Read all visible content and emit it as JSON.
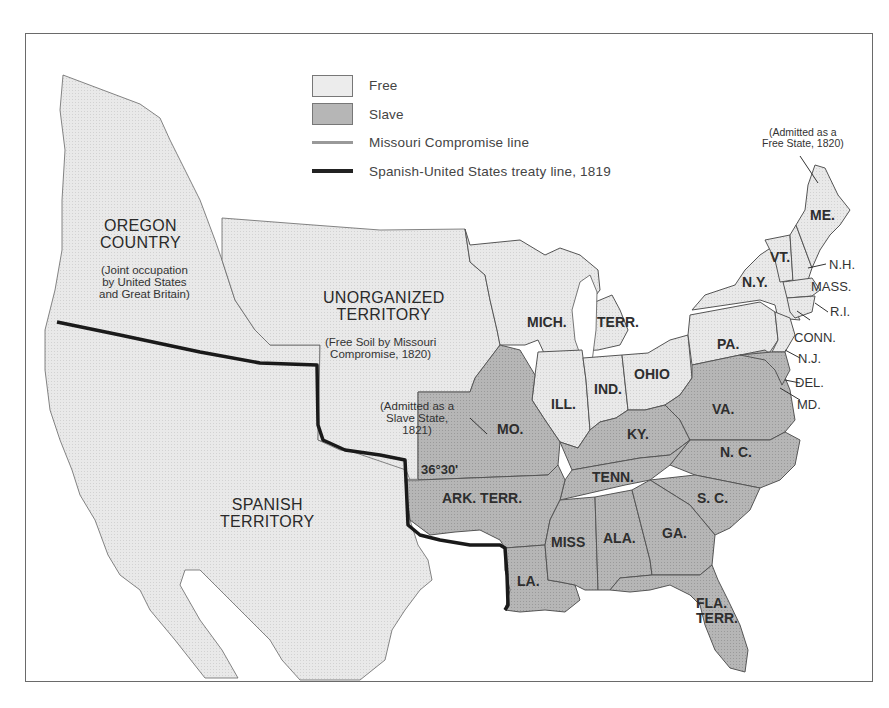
{
  "map": {
    "colors": {
      "free": "#e9e9e9",
      "slave": "#b3b3b3",
      "water": "#ffffff",
      "border": "#555555",
      "treaty_line": "#1a1a1a",
      "compromise_line": "#8a8a8a"
    },
    "legend": [
      {
        "key": "free",
        "label": "Free",
        "kind": "swatch"
      },
      {
        "key": "slave",
        "label": "Slave",
        "kind": "swatch"
      },
      {
        "key": "missouri_line",
        "label": "Missouri Compromise line",
        "kind": "thin-line"
      },
      {
        "key": "treaty_line",
        "label": "Spanish-United States treaty  line, 1819",
        "kind": "thick-line"
      }
    ],
    "regions": {
      "oregon": {
        "name_line1": "OREGON",
        "name_line2": "COUNTRY",
        "note": [
          "(Joint occupation",
          "by United States",
          "and Great Britain)"
        ]
      },
      "unorganized": {
        "name_line1": "UNORGANIZED",
        "name_line2": "TERRITORY",
        "note": [
          "(Free Soil by Missouri",
          "Compromise, 1820)"
        ]
      },
      "spanish": {
        "name_line1": "SPANISH",
        "name_line2": "TERRITORY"
      }
    },
    "annotations": {
      "missouri": [
        "(Admitted as a",
        "Slave State,",
        "1821)"
      ],
      "maine": [
        "(Admitted as a",
        "Free State, 1820)"
      ],
      "latitude": "36°30'"
    },
    "states": {
      "me": "ME.",
      "vt": "VT.",
      "nh": "N.H.",
      "ny": "N.Y.",
      "mass": "MASS.",
      "ri": "R.I.",
      "conn": "CONN.",
      "nj": "N.J.",
      "pa": "PA.",
      "del": "DEL.",
      "md": "MD.",
      "mich": "MICH.",
      "terr": "TERR.",
      "ohio": "OHIO",
      "ind": "IND.",
      "ill": "ILL.",
      "mo": "MO.",
      "ky": "KY.",
      "va": "VA.",
      "nc": "N. C.",
      "tenn": "TENN.",
      "sc": "S. C.",
      "ark": "ARK. TERR.",
      "miss": "MISS",
      "ala": "ALA.",
      "ga": "GA.",
      "la": "LA.",
      "fla1": "FLA.",
      "fla2": "TERR."
    }
  }
}
